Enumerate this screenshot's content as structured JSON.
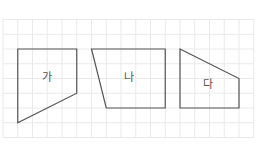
{
  "grid": {
    "origin_x": 3,
    "origin_y": 19.5,
    "cell": 14.75,
    "cols": 17,
    "rows": 8,
    "line_color": "#e9e9e9"
  },
  "shape_stroke_color": "#555555",
  "shapes": [
    {
      "label": "가",
      "vertices_grid": [
        [
          1,
          2
        ],
        [
          5,
          2
        ],
        [
          5,
          5
        ],
        [
          1,
          7
        ]
      ],
      "label_pos": [
        47,
        78
      ]
    },
    {
      "label": "나",
      "vertices_grid": [
        [
          6,
          2
        ],
        [
          11,
          2
        ],
        [
          11,
          6
        ],
        [
          7,
          6
        ]
      ],
      "label_pos": [
        129,
        78
      ]
    },
    {
      "label": "다",
      "vertices_grid": [
        [
          12,
          2
        ],
        [
          16,
          4
        ],
        [
          16,
          6
        ],
        [
          12,
          6
        ]
      ],
      "label_pos": [
        208,
        85
      ]
    }
  ]
}
